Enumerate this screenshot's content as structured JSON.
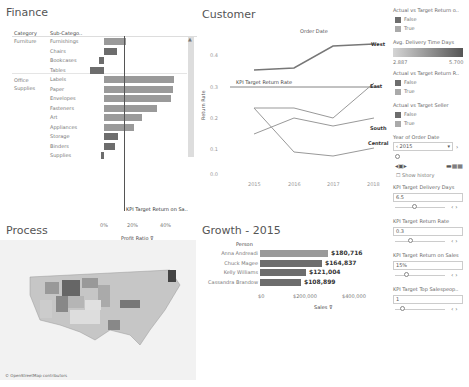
{
  "finance": {
    "title": "Finance",
    "col_category": "Category",
    "col_subcategory": "Sub-Catego..",
    "categories": [
      {
        "name": "Furniture",
        "rows": [
          {
            "label": "Furnishings",
            "value": 14,
            "dark": false
          },
          {
            "label": "Chairs",
            "value": 8,
            "dark": true
          },
          {
            "label": "Bookcases",
            "value": -3,
            "dark": true
          },
          {
            "label": "Tables",
            "value": -9,
            "dark": true
          }
        ]
      },
      {
        "name": "Office Supplies",
        "rows": [
          {
            "label": "Labels",
            "value": 44,
            "dark": false
          },
          {
            "label": "Paper",
            "value": 43,
            "dark": false
          },
          {
            "label": "Envelopes",
            "value": 42,
            "dark": false
          },
          {
            "label": "Fasteners",
            "value": 33,
            "dark": false
          },
          {
            "label": "Art",
            "value": 24,
            "dark": false
          },
          {
            "label": "Appliances",
            "value": 19,
            "dark": false
          },
          {
            "label": "Storage",
            "value": 9,
            "dark": true
          },
          {
            "label": "Binders",
            "value": 7,
            "dark": true
          },
          {
            "label": "Supplies",
            "value": -2,
            "dark": true
          }
        ]
      }
    ],
    "reference_label": "KPI Target Return on Sa..",
    "axis_ticks": [
      "0%",
      "20%",
      "40%"
    ],
    "axis_label": "Profit Ratio"
  },
  "customer": {
    "title": "Customer",
    "header": "Order Date",
    "y_label": "Return Rate",
    "reference_label": "KPI Target Return Rate",
    "y_ticks": [
      "0.4",
      "0.3",
      "0.2",
      "0.1",
      "0.0"
    ],
    "x_ticks": [
      "2015",
      "2016",
      "2017",
      "2018"
    ],
    "series_labels": [
      "West",
      "East",
      "South",
      "Central"
    ]
  },
  "chart_data": [
    {
      "type": "bar",
      "title": "Finance",
      "xlabel": "Profit Ratio",
      "categories": [
        "Furnishings",
        "Chairs",
        "Bookcases",
        "Tables",
        "Labels",
        "Paper",
        "Envelopes",
        "Fasteners",
        "Art",
        "Appliances",
        "Storage",
        "Binders",
        "Supplies"
      ],
      "values": [
        14,
        8,
        -3,
        -9,
        44,
        43,
        42,
        33,
        24,
        19,
        9,
        7,
        -2
      ],
      "reference_line": 13
    },
    {
      "type": "line",
      "title": "Customer",
      "ylabel": "Return Rate",
      "x": [
        "2015",
        "2016",
        "2017",
        "2018"
      ],
      "series": [
        {
          "name": "West",
          "values": [
            0.36,
            0.37,
            0.46,
            0.47
          ]
        },
        {
          "name": "East",
          "values": [
            0.2,
            0.2,
            0.17,
            0.31
          ]
        },
        {
          "name": "South",
          "values": [
            0.12,
            0.17,
            0.14,
            0.17
          ]
        },
        {
          "name": "Central",
          "values": [
            0.2,
            0.08,
            0.07,
            0.1
          ]
        }
      ],
      "reference_line": 0.3,
      "ylim": [
        0,
        0.5
      ]
    },
    {
      "type": "bar",
      "title": "Growth - 2015",
      "xlabel": "Sales",
      "categories": [
        "Anna Andreadi",
        "Chuck Magee",
        "Kelly Williams",
        "Cassandra Brandow"
      ],
      "values": [
        180716,
        164837,
        121004,
        108899
      ],
      "xlim": [
        0,
        400000
      ]
    }
  ],
  "process": {
    "title": "Process",
    "attribution": "© OpenStreetMap contributors"
  },
  "growth": {
    "title": "Growth - 2015",
    "header": "Person",
    "rows": [
      {
        "name": "Anna Andreadi",
        "value_label": "$180,716",
        "width": 68,
        "dark": false
      },
      {
        "name": "Chuck Magee",
        "value_label": "$164,837",
        "width": 62,
        "dark": true
      },
      {
        "name": "Kelly Williams",
        "value_label": "$121,004",
        "width": 46,
        "dark": true
      },
      {
        "name": "Cassandra Brandow",
        "value_label": "$108,899",
        "width": 41,
        "dark": true
      }
    ],
    "axis_ticks": [
      "$0",
      "$200,000",
      "$400,000"
    ],
    "axis_label": "Sales"
  },
  "sidebar": {
    "legend1_title": "Actual vs Target Return o..",
    "legend1_items": [
      "False",
      "True"
    ],
    "gradient_title": "Avg. Delivery Time Days",
    "gradient_min": "2.887",
    "gradient_max": "5.700",
    "legend2_title": "Actual vs Target Return R..",
    "legend2_items": [
      "False",
      "True"
    ],
    "legend3_title": "Actual vs Target Seller",
    "legend3_items": [
      "False",
      "True"
    ],
    "year_title": "Year of Order Date",
    "year_value": "2015",
    "show_history": "Show history",
    "params": [
      {
        "title": "KPI Target Delivery Days",
        "value": "6.5"
      },
      {
        "title": "KPI Target Return Rate",
        "value": "0.3"
      },
      {
        "title": "KPI Target Return on Sales",
        "value": "15%"
      },
      {
        "title": "KPI Target Top Salespeop..",
        "value": "1"
      }
    ]
  },
  "colors": {
    "dark_bar": "#6d6d6d",
    "light_bar": "#9a9a9a",
    "line": "#888888"
  }
}
